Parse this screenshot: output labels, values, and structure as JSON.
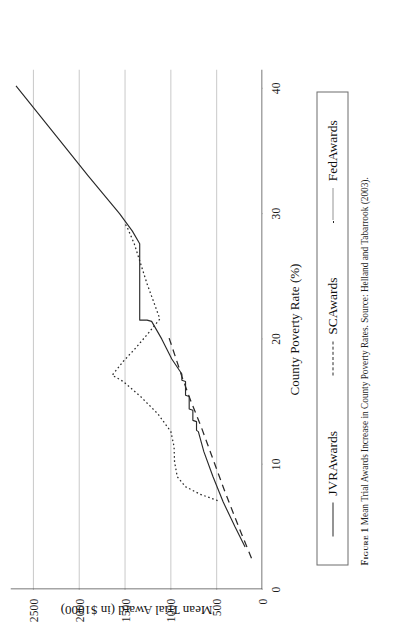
{
  "figure": {
    "number_label": "Figure 1",
    "caption_text": "Mean Trial Awards Increase in County Poverty Rates. Source: Helland and Tabarrook (2003)."
  },
  "legend": {
    "position": "below-plot",
    "entries": [
      {
        "label": "JVRAwards",
        "style": "solid",
        "swatch": "solid-line-swatch"
      },
      {
        "label": "SCAwards",
        "style": "dashed",
        "swatch": "dashed-line-swatch"
      },
      {
        "label": "FedAwards",
        "style": "dotted",
        "swatch": "dotted-line-swatch"
      }
    ]
  },
  "colors": {
    "line": "#2a2a2a",
    "grid": "#c9c9c9",
    "axis": "#4a4a4a",
    "text": "#1b1b1b",
    "background": "#ffffff"
  },
  "chart_data": {
    "type": "line",
    "title": "",
    "xlabel": "County Poverty Rate (%)",
    "ylabel": "Mean Trial Award (in $1000)",
    "xlim": [
      0,
      41.5
    ],
    "ylim": [
      0,
      2750
    ],
    "xticks": [
      0,
      10,
      20,
      30,
      40
    ],
    "yticks": [
      0,
      500,
      1000,
      1500,
      2000,
      2500
    ],
    "xtick_labels": [
      "0",
      "10",
      "20",
      "30",
      "40"
    ],
    "ytick_labels": [
      "0",
      "500",
      "1000",
      "1500",
      "2000",
      "2500"
    ],
    "grid": "vertical-gridlines-at-yticks",
    "series": [
      {
        "name": "JVRAwards",
        "style": "solid",
        "points": [
          [
            3.4,
            190
          ],
          [
            5.0,
            300
          ],
          [
            7.0,
            430
          ],
          [
            9.0,
            540
          ],
          [
            11.0,
            640
          ],
          [
            12.6,
            700
          ],
          [
            12.7,
            720
          ],
          [
            13.4,
            720
          ],
          [
            13.5,
            760
          ],
          [
            14.3,
            760
          ],
          [
            14.4,
            800
          ],
          [
            15.4,
            800
          ],
          [
            15.5,
            840
          ],
          [
            16.6,
            840
          ],
          [
            16.7,
            880
          ],
          [
            17.2,
            880
          ],
          [
            18.4,
            990
          ],
          [
            20.0,
            1100
          ],
          [
            21.4,
            1210
          ],
          [
            21.5,
            1260
          ],
          [
            21.5,
            1290
          ],
          [
            21.5,
            1320
          ],
          [
            21.5,
            1340
          ],
          [
            21.6,
            1340
          ],
          [
            27.6,
            1340
          ],
          [
            28.6,
            1420
          ],
          [
            30.0,
            1560
          ],
          [
            33.0,
            1900
          ],
          [
            36.0,
            2230
          ],
          [
            40.2,
            2690
          ]
        ]
      },
      {
        "name": "SCAwards",
        "style": "dashed",
        "points": [
          [
            2.5,
            120
          ],
          [
            5.0,
            260
          ],
          [
            8.0,
            420
          ],
          [
            11.0,
            570
          ],
          [
            13.0,
            670
          ],
          [
            15.0,
            780
          ],
          [
            17.0,
            880
          ],
          [
            19.0,
            970
          ],
          [
            20.3,
            1030
          ]
        ]
      },
      {
        "name": "FedAwards",
        "style": "dotted",
        "points": [
          [
            7.1,
            490
          ],
          [
            7.6,
            680
          ],
          [
            8.2,
            840
          ],
          [
            9.0,
            930
          ],
          [
            10.2,
            960
          ],
          [
            11.4,
            965
          ],
          [
            12.6,
            1000
          ],
          [
            14.0,
            1140
          ],
          [
            15.4,
            1330
          ],
          [
            16.6,
            1520
          ],
          [
            17.1,
            1640
          ],
          [
            18.2,
            1520
          ],
          [
            19.3,
            1380
          ],
          [
            20.6,
            1230
          ],
          [
            21.6,
            1120
          ],
          [
            23.0,
            1190
          ],
          [
            24.4,
            1260
          ],
          [
            26.0,
            1330
          ],
          [
            27.6,
            1400
          ],
          [
            28.8,
            1470
          ],
          [
            29.2,
            1500
          ]
        ]
      }
    ]
  }
}
